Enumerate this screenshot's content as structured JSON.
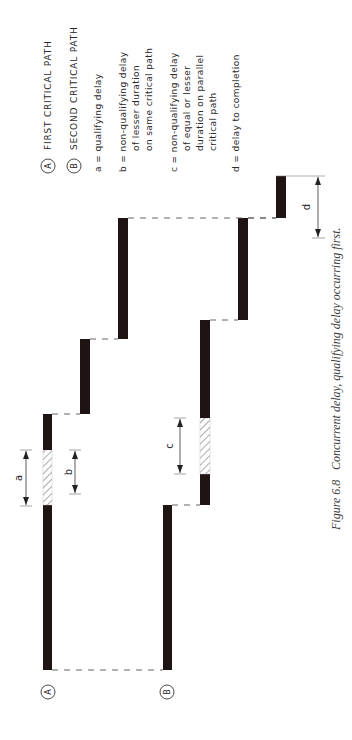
{
  "figure": {
    "caption_label": "Figure 6.8",
    "caption_text": "Concurrent delay, qualifying delay occurring first.",
    "orientation": "rotated 90° counter-clockwise"
  },
  "legend": {
    "paths": [
      {
        "marker": "A",
        "label": "FIRST CRITICAL PATH"
      },
      {
        "marker": "B",
        "label": "SECOND CRITICAL PATH"
      }
    ],
    "definitions": [
      {
        "key": "a",
        "lines": [
          "a = qualifying delay"
        ]
      },
      {
        "key": "b",
        "lines": [
          "b = non-qualifying delay",
          "of lesser duration",
          "on same critical path"
        ]
      },
      {
        "key": "c",
        "lines": [
          "c = non-qualifying delay",
          "of equal or lesser",
          "duration on parallel",
          "critical path"
        ]
      },
      {
        "key": "d",
        "lines": [
          "d = delay to completion"
        ]
      }
    ]
  },
  "path_markers": {
    "a": "A",
    "b": "B"
  },
  "dimension_labels": {
    "a": "a",
    "b": "b",
    "c": "c",
    "d": "d"
  },
  "colors": {
    "bar": "#1e1414",
    "hatch": "#666666",
    "text": "#2a2a2a"
  }
}
